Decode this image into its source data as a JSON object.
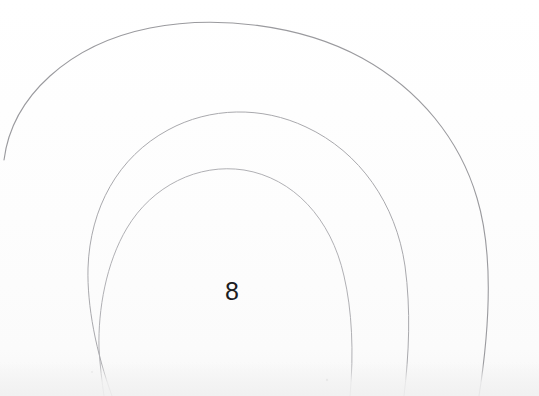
{
  "canvas": {
    "width": 539,
    "height": 396,
    "background_color": "#fefefe",
    "paper_tint": "#fbfbfb",
    "medium": "scanned pencil drawing on white paper"
  },
  "artwork": {
    "title": "Concentric circular arcs with centre digit",
    "stroke_color": "#a8a8ac",
    "stroke_color_strong": "#8e8e93",
    "stroke_width": 1,
    "center_x": 228,
    "center_y": 234,
    "label_text": "8",
    "label_color": "#1d1d1f",
    "label_x": 225,
    "label_y": 279,
    "label_font_size": 25,
    "rings": [
      {
        "name": "outer-ring",
        "radius": 198,
        "center_x": 228,
        "center_y": 233,
        "stroke_color": "#9a9a9e",
        "stroke_width": 1.1,
        "start_angle_deg": 176,
        "end_angle_deg": 430,
        "note": "terminates abruptly near left edge at approx (4,160)"
      },
      {
        "name": "middle-ring",
        "radius": 143,
        "center_x": 229,
        "center_y": 236,
        "stroke_color": "#a9a9ad",
        "stroke_width": 1,
        "start_angle_deg": 155,
        "end_angle_deg": 415,
        "note": "exits through bottom edge on both sides"
      },
      {
        "name": "inner-ring",
        "radius": 111,
        "center_x": 228,
        "center_y": 237,
        "stroke_color": "#b0b0b4",
        "stroke_width": 1,
        "start_angle_deg": 150,
        "end_angle_deg": 410,
        "note": "exits through bottom edge on both sides"
      }
    ],
    "specks": [
      {
        "name": "dust-speck-1",
        "x": 327,
        "y": 380,
        "size": 2
      },
      {
        "name": "dust-speck-2",
        "x": 92,
        "y": 372,
        "size": 1
      }
    ]
  },
  "chart_data": {
    "type": "scatter",
    "xlabel": "",
    "ylabel": "",
    "xlim": [
      0,
      539
    ],
    "ylim": [
      396,
      0
    ],
    "grid": false,
    "legend": "none",
    "annotations": [
      {
        "text": "8",
        "x": 232,
        "y": 291
      }
    ],
    "series": [
      {
        "name": "outer-ring",
        "radius": 198,
        "center": [
          228,
          233
        ]
      },
      {
        "name": "middle-ring",
        "radius": 143,
        "center": [
          229,
          236
        ]
      },
      {
        "name": "inner-ring",
        "radius": 111,
        "center": [
          228,
          237
        ]
      }
    ]
  }
}
